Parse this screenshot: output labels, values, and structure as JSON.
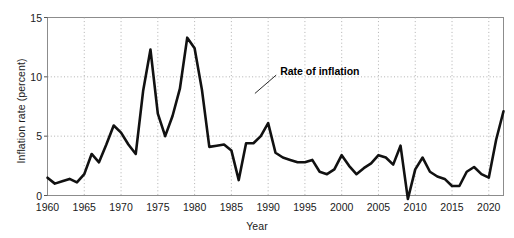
{
  "chart_data": {
    "type": "line",
    "title": "",
    "xlabel": "Year",
    "ylabel": "Inflation rate (percent)",
    "xlim": [
      1960,
      2022
    ],
    "ylim": [
      0,
      15
    ],
    "yticks": [
      0,
      5,
      10,
      15
    ],
    "xticks": [
      1960,
      1965,
      1970,
      1975,
      1980,
      1985,
      1990,
      1995,
      2000,
      2005,
      2010,
      2015,
      2020
    ],
    "grid": "dotted gridlines on both axes",
    "legend": "none",
    "line_color": "#000000",
    "annotations": [
      {
        "text": "Rate of inflation",
        "x": 1991.5,
        "y": 10.4,
        "leader_to_x": 1988.2,
        "leader_to_y": 8.6
      }
    ],
    "series": [
      {
        "name": "Rate of inflation",
        "x": [
          1960,
          1961,
          1962,
          1963,
          1964,
          1965,
          1966,
          1967,
          1968,
          1969,
          1970,
          1971,
          1972,
          1973,
          1974,
          1975,
          1976,
          1977,
          1978,
          1979,
          1980,
          1981,
          1982,
          1983,
          1984,
          1985,
          1986,
          1987,
          1988,
          1989,
          1990,
          1991,
          1992,
          1993,
          1994,
          1995,
          1996,
          1997,
          1998,
          1999,
          2000,
          2001,
          2002,
          2003,
          2004,
          2005,
          2006,
          2007,
          2008,
          2009,
          2010,
          2011,
          2012,
          2013,
          2014,
          2015,
          2016,
          2017,
          2018,
          2019,
          2020,
          2021,
          2022
        ],
        "values": [
          1.5,
          1.0,
          1.2,
          1.4,
          1.1,
          1.8,
          3.5,
          2.8,
          4.3,
          5.9,
          5.3,
          4.3,
          3.5,
          8.8,
          12.3,
          6.9,
          5.0,
          6.7,
          9.0,
          13.3,
          12.4,
          8.9,
          4.1,
          4.2,
          4.3,
          3.8,
          1.3,
          4.4,
          4.4,
          5.0,
          6.1,
          3.6,
          3.2,
          3.0,
          2.8,
          2.8,
          3.0,
          2.0,
          1.8,
          2.2,
          3.4,
          2.5,
          1.8,
          2.3,
          2.7,
          3.4,
          3.2,
          2.6,
          4.2,
          -0.3,
          2.2,
          3.2,
          2.0,
          1.6,
          1.4,
          0.8,
          0.8,
          2.0,
          2.4,
          1.8,
          1.5,
          4.7,
          7.1
        ]
      }
    ]
  },
  "axes": {
    "ylabel": "Inflation rate (percent)",
    "xlabel": "Year"
  }
}
